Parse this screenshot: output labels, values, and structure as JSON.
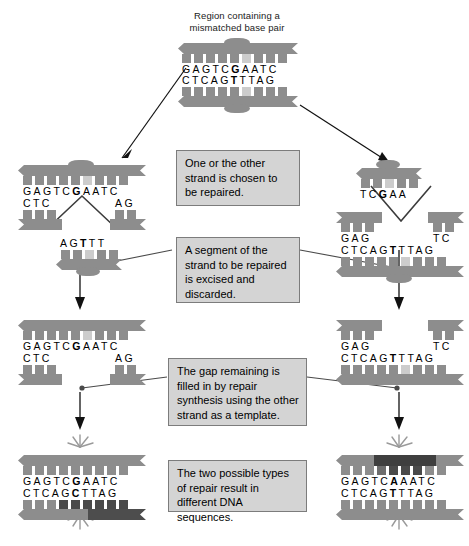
{
  "caption": {
    "line1": "Region containing a",
    "line2": "mismatched base pair"
  },
  "callouts": {
    "step1": "One or the other strand is chosen to be repaired.",
    "step2": "A segment of the strand to be repaired is excised and discarded.",
    "step3": "The gap remaining is filled in by repair synthesis using the other strand as a template.",
    "step4": "The two possible types of repair result in different DNA sequences."
  },
  "panels": {
    "top": {
      "name": "mismatched-duplex",
      "top_strand": "GAGTC",
      "top_mismatch": "G",
      "top_strand2": "AATC",
      "bottom_strand": "CTCAG",
      "bottom_mismatch": "T",
      "bottom_strand2": "TTAG"
    },
    "left_mid": {
      "name": "left-strand-nicked",
      "top_strand": "GAGTC",
      "top_mismatch": "G",
      "top_strand2": "AATC",
      "bottom_left": "CTC",
      "bottom_right": "AG",
      "excised_pre": "AG",
      "excised_mismatch": "T",
      "excised_post": "TT"
    },
    "right_mid": {
      "name": "right-strand-nicked",
      "excised_pre": "TC",
      "excised_mismatch": "G",
      "excised_post": "AA",
      "top_left": "GAG",
      "top_right": "TC",
      "bottom_strand": "CTCAG",
      "bottom_mismatch": "T",
      "bottom_strand2": "TTAG"
    },
    "left_gap": {
      "name": "left-gapped-duplex",
      "top_strand": "GAGTC",
      "top_mismatch": "G",
      "top_strand2": "AATC",
      "bottom_left": "CTC",
      "bottom_right": "AG"
    },
    "right_gap": {
      "name": "right-gapped-duplex",
      "top_left": "GAG",
      "top_right": "TC",
      "bottom_strand": "CTCAG",
      "bottom_mismatch": "T",
      "bottom_strand2": "TTAG"
    },
    "left_final": {
      "name": "repaired-gc-duplex",
      "top_strand": "GAGTC",
      "top_mismatch": "G",
      "top_strand2": "AATC",
      "bottom_strand": "CTCAG",
      "bottom_mismatch": "C",
      "bottom_strand2": "TTAG"
    },
    "right_final": {
      "name": "repaired-at-duplex",
      "top_strand": "GAGTC",
      "top_mismatch": "A",
      "top_strand2": "AATC",
      "bottom_strand": "CTCAG",
      "bottom_mismatch": "T",
      "bottom_strand2": "TTAG"
    }
  },
  "colors": {
    "strand": "#8d8d8d",
    "new_strand": "#3f3f3f",
    "callout_bg": "#d4d4d4",
    "callout_border": "#7c7c7c",
    "wire": "#4a4a4a"
  }
}
